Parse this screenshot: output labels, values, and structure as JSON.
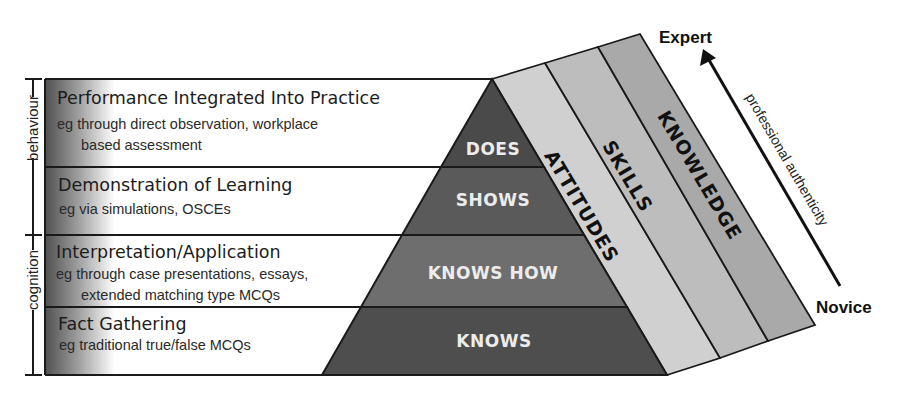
{
  "diagram": {
    "rows": [
      {
        "title": "Performance Integrated Into Practice",
        "lines": [
          "eg through direct observation, workplace",
          "based assessment"
        ]
      },
      {
        "title": "Demonstration of Learning",
        "lines": [
          "eg via simulations, OSCEs"
        ]
      },
      {
        "title": "Interpretation/Application",
        "lines": [
          "eg through case presentations, essays,",
          "extended matching type MCQs"
        ]
      },
      {
        "title": "Fact Gathering",
        "lines": [
          "eg traditional true/false MCQs"
        ]
      }
    ],
    "pyramid": {
      "tiers": [
        "DOES",
        "SHOWS",
        "KNOWS HOW",
        "KNOWS"
      ],
      "colors": [
        "#4a4a4a",
        "#5a5a5a",
        "#6e6e6e",
        "#4e4e4e"
      ]
    },
    "strips": {
      "labels": [
        "ATTITUDES",
        "SKILLS",
        "KNOWLEDGE"
      ],
      "colors": [
        "#d0d0d0",
        "#bdbdbd",
        "#a9a9a9"
      ]
    },
    "brackets": {
      "upper": "behaviour",
      "lower": "cognition"
    },
    "axis": {
      "top_label": "Expert",
      "bottom_label": "Novice",
      "label": "professional authenticity"
    }
  }
}
